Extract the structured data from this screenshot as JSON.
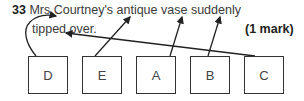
{
  "question": {
    "number": "33",
    "text_line1": "Mrs Courtney's antique vase suddenly",
    "text_line2": "tipped over.",
    "marks": "(1 mark)"
  },
  "boxes": [
    {
      "label": "D",
      "points_to": "Mrs"
    },
    {
      "label": "E",
      "points_to": "antique"
    },
    {
      "label": "A",
      "points_to": "vase"
    },
    {
      "label": "B",
      "points_to": "suddenly"
    },
    {
      "label": "C",
      "points_to": "tipped"
    }
  ]
}
